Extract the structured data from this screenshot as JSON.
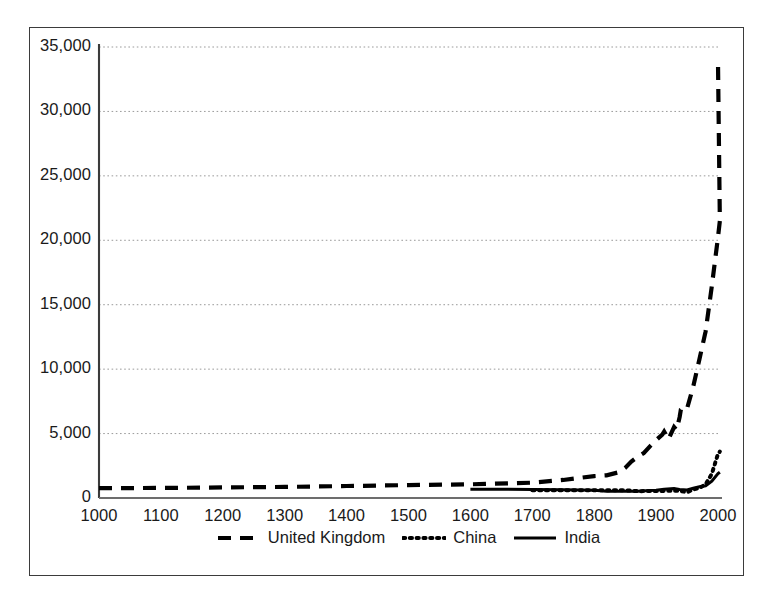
{
  "chart_data": {
    "type": "line",
    "title": "",
    "subtitle": "",
    "xlabel": "",
    "ylabel": "",
    "xlim": [
      1000,
      2000
    ],
    "ylim": [
      0,
      35000
    ],
    "grid": "horizontal-dotted",
    "legend_position": "bottom-center",
    "x_ticks": [
      1000,
      1100,
      1200,
      1300,
      1400,
      1500,
      1600,
      1700,
      1800,
      1900,
      2000
    ],
    "x_tick_labels": [
      "1000",
      "1100",
      "1200",
      "1300",
      "1400",
      "1500",
      "1600",
      "1700",
      "1800",
      "1900",
      "2000"
    ],
    "y_ticks": [
      0,
      5000,
      10000,
      15000,
      20000,
      25000,
      30000,
      35000
    ],
    "y_tick_labels": [
      "0",
      "5,000",
      "10,000",
      "15,000",
      "20,000",
      "25,000",
      "30,000",
      "35,000"
    ],
    "series": [
      {
        "name": "United Kingdom",
        "style": "dashed",
        "color": "#000000",
        "x": [
          1000,
          1100,
          1200,
          1300,
          1400,
          1500,
          1600,
          1700,
          1750,
          1800,
          1820,
          1840,
          1850,
          1860,
          1870,
          1880,
          1890,
          1900,
          1910,
          1913,
          1920,
          1929,
          1933,
          1938,
          1940,
          1945,
          1950,
          1960,
          1970,
          1980,
          1990,
          2000,
          2003
        ],
        "y": [
          760,
          780,
          820,
          860,
          930,
          1000,
          1060,
          1190,
          1400,
          1700,
          1760,
          2000,
          2330,
          2830,
          3190,
          3480,
          4010,
          4490,
          4920,
          5150,
          4550,
          5500,
          5280,
          6270,
          6860,
          7060,
          6940,
          8650,
          10770,
          12930,
          16430,
          20250,
          21500
        ],
        "y_right_end": 33800
      },
      {
        "name": "China",
        "style": "dotted",
        "color": "#000000",
        "x": [
          1700,
          1750,
          1800,
          1820,
          1850,
          1870,
          1890,
          1900,
          1913,
          1929,
          1938,
          1950,
          1960,
          1970,
          1980,
          1990,
          2000,
          2003
        ],
        "y": [
          600,
          600,
          600,
          600,
          600,
          530,
          540,
          545,
          552,
          562,
          562,
          448,
          662,
          778,
          1061,
          1871,
          3421,
          3600
        ]
      },
      {
        "name": "India",
        "style": "solid",
        "color": "#000000",
        "x": [
          1600,
          1650,
          1700,
          1750,
          1800,
          1820,
          1850,
          1870,
          1890,
          1900,
          1913,
          1929,
          1938,
          1950,
          1960,
          1970,
          1980,
          1990,
          2000,
          2003
        ],
        "y": [
          682,
          675,
          665,
          640,
          600,
          533,
          530,
          533,
          584,
          599,
          673,
          728,
          668,
          619,
          753,
          868,
          938,
          1309,
          1892,
          2000
        ]
      }
    ]
  },
  "legend": {
    "items": [
      {
        "label": "United Kingdom",
        "style": "dashed"
      },
      {
        "label": "China",
        "style": "dotted"
      },
      {
        "label": "India",
        "style": "solid"
      }
    ]
  }
}
